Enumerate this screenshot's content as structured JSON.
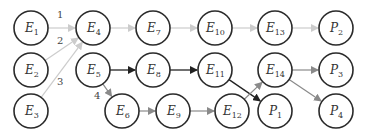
{
  "diagram": {
    "type": "directed-graph",
    "radius": 17,
    "colors": {
      "dark": "#222222",
      "mid": "#8a8a8a",
      "light": "#cccccc"
    },
    "nodes": [
      {
        "id": "E1",
        "base": "E",
        "sub": "1",
        "x": 31,
        "y": 28
      },
      {
        "id": "E2",
        "base": "E",
        "sub": "2",
        "x": 31,
        "y": 70
      },
      {
        "id": "E3",
        "base": "E",
        "sub": "3",
        "x": 31,
        "y": 111
      },
      {
        "id": "E4",
        "base": "E",
        "sub": "4",
        "x": 93,
        "y": 28
      },
      {
        "id": "E5",
        "base": "E",
        "sub": "5",
        "x": 93,
        "y": 70
      },
      {
        "id": "E6",
        "base": "E",
        "sub": "6",
        "x": 122,
        "y": 111
      },
      {
        "id": "E7",
        "base": "E",
        "sub": "7",
        "x": 153,
        "y": 28
      },
      {
        "id": "E8",
        "base": "E",
        "sub": "8",
        "x": 153,
        "y": 70
      },
      {
        "id": "E9",
        "base": "E",
        "sub": "9",
        "x": 173,
        "y": 111
      },
      {
        "id": "E10",
        "base": "E",
        "sub": "10",
        "x": 215,
        "y": 28
      },
      {
        "id": "E11",
        "base": "E",
        "sub": "11",
        "x": 215,
        "y": 70
      },
      {
        "id": "E12",
        "base": "E",
        "sub": "12",
        "x": 232,
        "y": 111
      },
      {
        "id": "E13",
        "base": "E",
        "sub": "13",
        "x": 275,
        "y": 28
      },
      {
        "id": "E14",
        "base": "E",
        "sub": "14",
        "x": 275,
        "y": 70
      },
      {
        "id": "P1",
        "base": "P",
        "sub": "1",
        "x": 275,
        "y": 111
      },
      {
        "id": "P2",
        "base": "P",
        "sub": "2",
        "x": 336,
        "y": 28
      },
      {
        "id": "P3",
        "base": "P",
        "sub": "3",
        "x": 336,
        "y": 70
      },
      {
        "id": "P4",
        "base": "P",
        "sub": "4",
        "x": 336,
        "y": 111
      }
    ],
    "edges": [
      {
        "from": "E1",
        "to": "E4",
        "color": "light",
        "label": "1",
        "lx": 57,
        "ly": 18
      },
      {
        "from": "E2",
        "to": "E4",
        "color": "light",
        "label": "2",
        "lx": 57,
        "ly": 44
      },
      {
        "from": "E3",
        "to": "E4",
        "color": "light",
        "label": "3",
        "lx": 57,
        "ly": 85
      },
      {
        "from": "E4",
        "to": "E7",
        "color": "light"
      },
      {
        "from": "E7",
        "to": "E10",
        "color": "light"
      },
      {
        "from": "E10",
        "to": "E13",
        "color": "light"
      },
      {
        "from": "E13",
        "to": "P2",
        "color": "light"
      },
      {
        "from": "E5",
        "to": "E8",
        "color": "dark"
      },
      {
        "from": "E8",
        "to": "E11",
        "color": "dark"
      },
      {
        "from": "E11",
        "to": "P1",
        "color": "dark"
      },
      {
        "from": "E5",
        "to": "E6",
        "color": "mid",
        "label": "4",
        "lx": 94,
        "ly": 99
      },
      {
        "from": "E6",
        "to": "E9",
        "color": "mid"
      },
      {
        "from": "E9",
        "to": "E12",
        "color": "mid"
      },
      {
        "from": "E12",
        "to": "E14",
        "color": "mid"
      },
      {
        "from": "E14",
        "to": "P3",
        "color": "mid"
      },
      {
        "from": "E14",
        "to": "P4",
        "color": "mid"
      }
    ]
  }
}
